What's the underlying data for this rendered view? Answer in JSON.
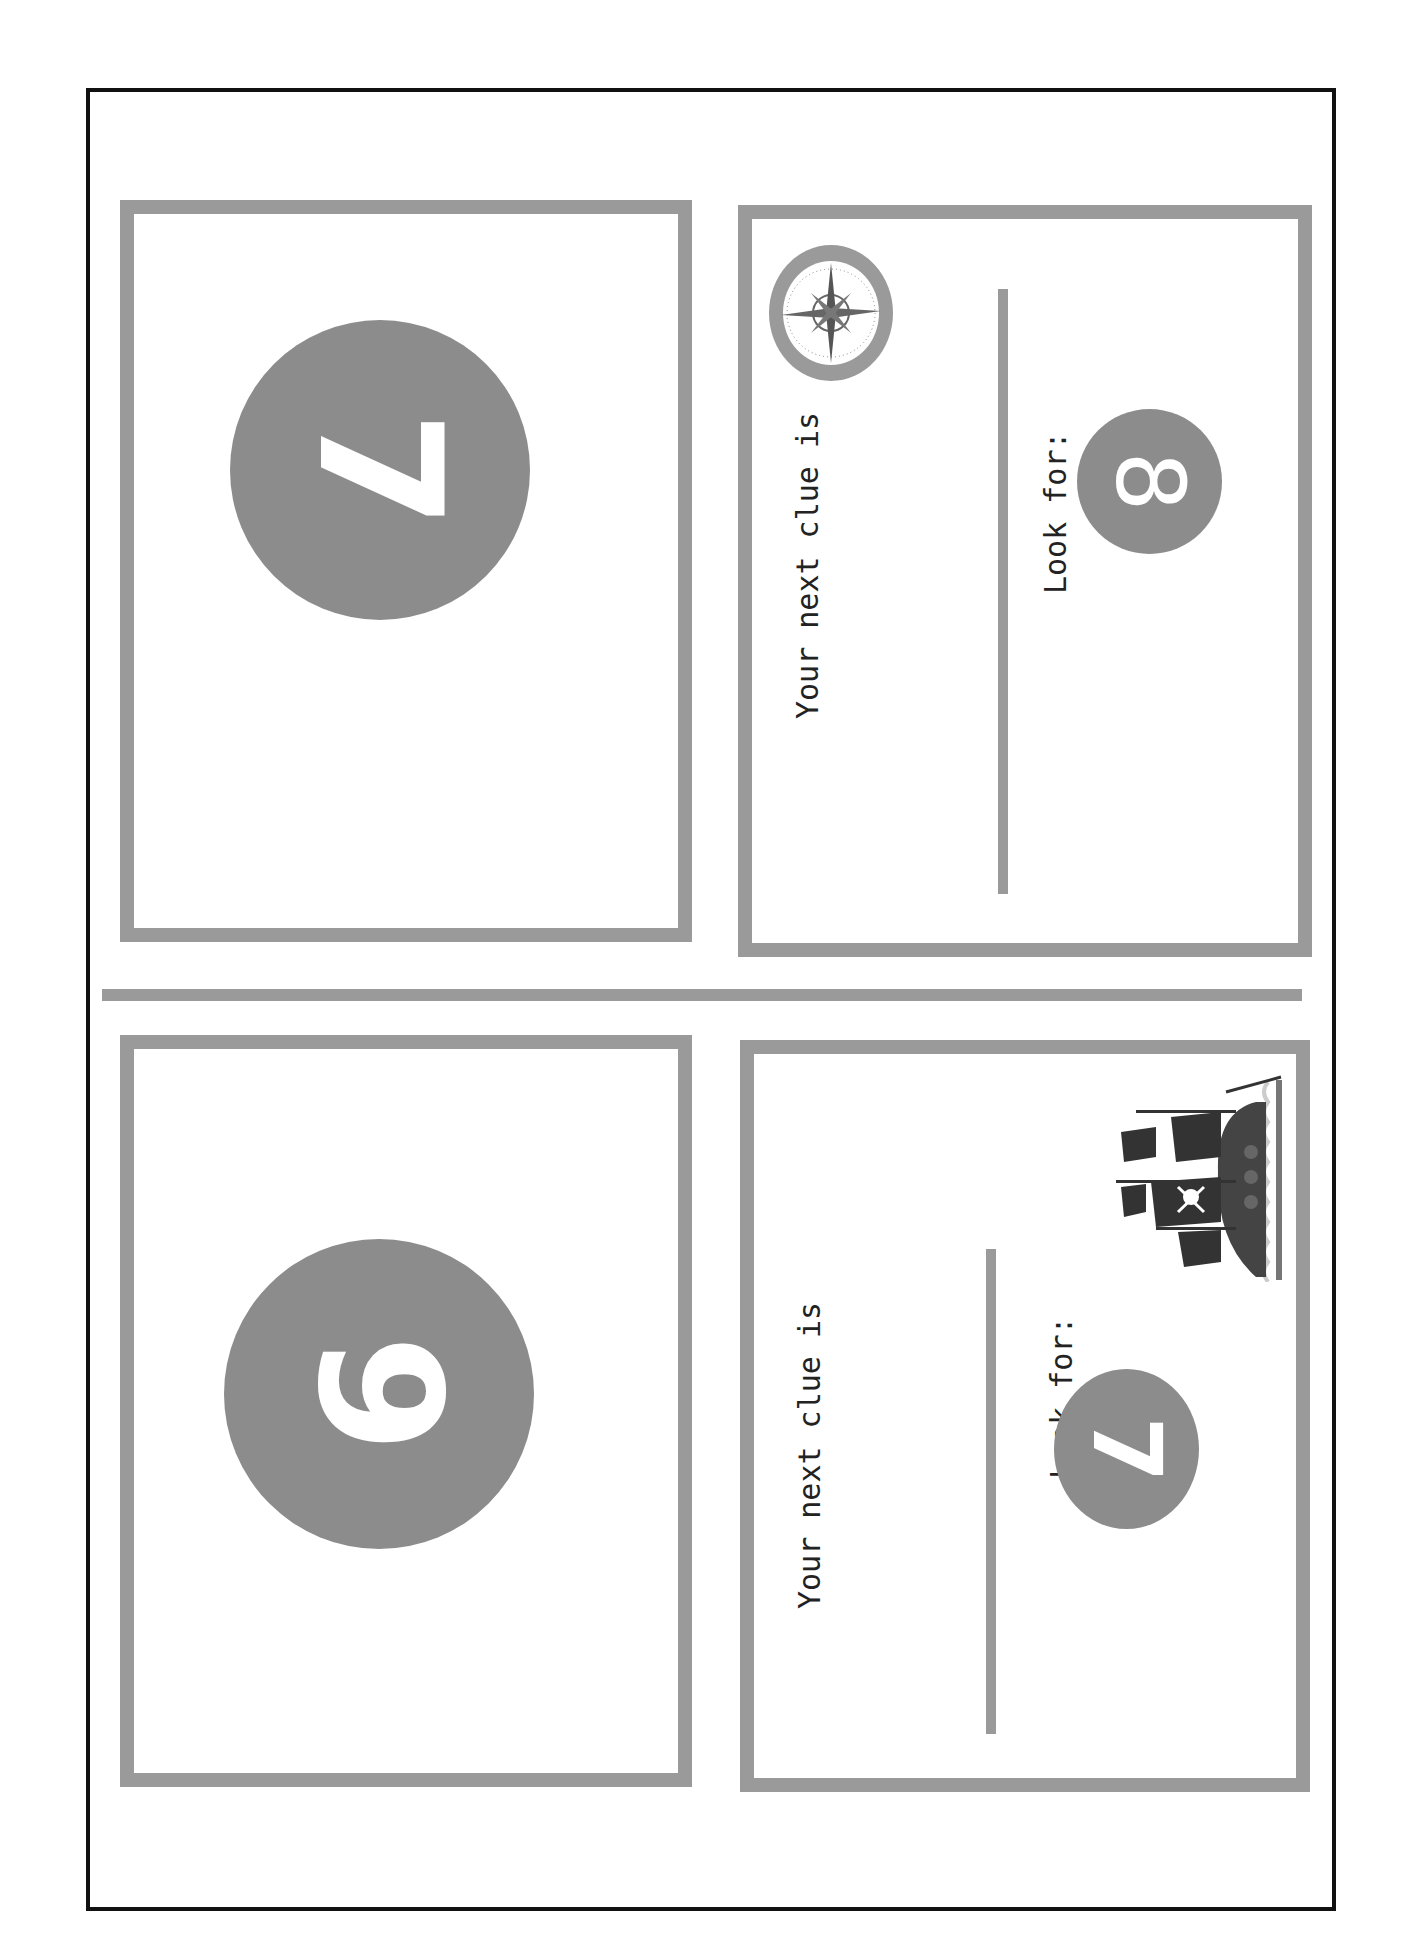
{
  "page": {
    "type": "printable scavenger hunt clue cards",
    "orientation": "rotated 90 degrees",
    "colors": {
      "border": "#9a9a9a",
      "circle": "#8c8c8c",
      "text": "#222222",
      "frame": "#111111"
    }
  },
  "top_half": {
    "number_card": {
      "number": "7"
    },
    "clue_card": {
      "heading": "Your next clue is",
      "look_for_label": "Look for:",
      "look_for_number": "8",
      "decoration": "compass-icon"
    }
  },
  "bottom_half": {
    "number_card": {
      "number": "9"
    },
    "clue_card": {
      "heading": "Your next clue is",
      "look_for_label": "Look for:",
      "look_for_number": "7",
      "decoration": "pirate-ship-icon"
    }
  }
}
